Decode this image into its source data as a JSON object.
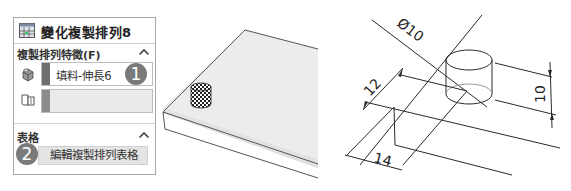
{
  "panel": {
    "title": "變化複製排列8",
    "title_icon": "variable-pattern-icon",
    "sections": [
      {
        "label": "複製排列特徵(F)",
        "collapse_icon": "chevron-up-icon",
        "rows": [
          {
            "icon": "feature-icon",
            "value": "填料-伸長6",
            "bar_color": "#6e6e6e",
            "badge": "1"
          },
          {
            "icon": "reference-face-icon",
            "value": "",
            "bar_color": "#8c8c8c",
            "badge": ""
          }
        ]
      },
      {
        "label": "表格",
        "collapse_icon": "chevron-up-icon",
        "button_label": "編輯複製排列表格",
        "badge": "2"
      }
    ]
  },
  "model_view": {
    "description": "Isometric plate with a small cylinder boss highlighted (checkered selection)"
  },
  "drawing": {
    "dimensions": {
      "diameter": "Ø10",
      "height": "10",
      "offset_y": "12",
      "offset_x": "14"
    }
  },
  "colors": {
    "badge": "#7a7a7a",
    "panel_border": "#a8a8a8",
    "plate_fill": "#ececec",
    "line": "#333333"
  }
}
